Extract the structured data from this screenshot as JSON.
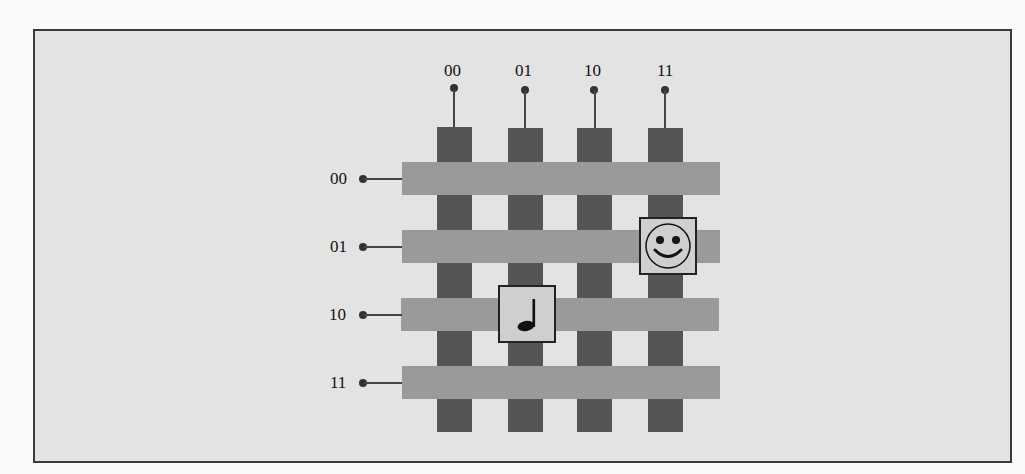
{
  "diagram": {
    "title": "",
    "column_labels": [
      "00",
      "01",
      "10",
      "11"
    ],
    "row_labels": [
      "00",
      "01",
      "10",
      "11"
    ],
    "cells": [
      {
        "row": "01",
        "column": "11",
        "icon": "smiley-face-icon"
      },
      {
        "row": "10",
        "column": "01",
        "icon": "music-note-icon"
      }
    ],
    "colors": {
      "background": "#e3e3e3",
      "column_wire": "#555555",
      "row_wire": "#9a9a9a",
      "cell_fill": "#cfcfcf",
      "border": "#3a3a3a"
    }
  }
}
